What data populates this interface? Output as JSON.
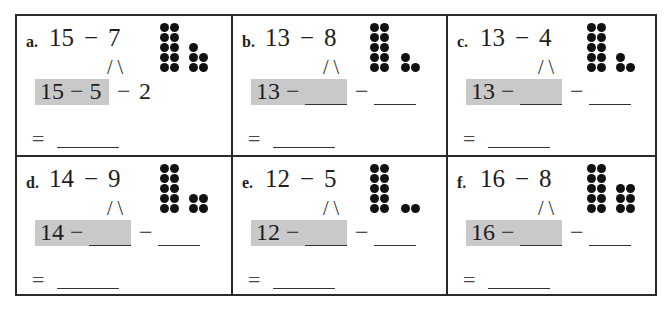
{
  "worksheet": {
    "problems": [
      {
        "label": "a.",
        "minuend": "15",
        "minus": "−",
        "subtrahend": "7",
        "split": "/   \\",
        "highlight_text": "15 − 5",
        "part1": "5",
        "rest_minus": "−",
        "part2": "2",
        "equals": "=",
        "tens_dots": 10,
        "ones_rows": [
          1,
          2,
          2
        ],
        "filled": true
      },
      {
        "label": "b.",
        "minuend": "13",
        "minus": "−",
        "subtrahend": "8",
        "split": "/   \\",
        "highlight_text": "13 −",
        "part1": "",
        "rest_minus": "−",
        "part2": "",
        "equals": "=",
        "tens_dots": 10,
        "ones_rows": [
          1,
          2
        ],
        "filled": false
      },
      {
        "label": "c.",
        "minuend": "13",
        "minus": "−",
        "subtrahend": "4",
        "split": "/   \\",
        "highlight_text": "13 −",
        "part1": "",
        "rest_minus": "−",
        "part2": "",
        "equals": "=",
        "tens_dots": 10,
        "ones_rows": [
          1,
          2
        ],
        "filled": false
      },
      {
        "label": "d.",
        "minuend": "14",
        "minus": "−",
        "subtrahend": "9",
        "split": "/   \\",
        "highlight_text": "14 −",
        "part1": "",
        "rest_minus": "−",
        "part2": "",
        "equals": "=",
        "tens_dots": 10,
        "ones_rows": [
          2,
          2
        ],
        "filled": false
      },
      {
        "label": "e.",
        "minuend": "12",
        "minus": "−",
        "subtrahend": "5",
        "split": "/   \\",
        "highlight_text": "12 −",
        "part1": "",
        "rest_minus": "−",
        "part2": "",
        "equals": "=",
        "tens_dots": 10,
        "ones_rows": [
          2
        ],
        "filled": false
      },
      {
        "label": "f.",
        "minuend": "16",
        "minus": "−",
        "subtrahend": "8",
        "split": "/   \\",
        "highlight_text": "16 −",
        "part1": "",
        "rest_minus": "−",
        "part2": "",
        "equals": "=",
        "tens_dots": 10,
        "ones_rows": [
          2,
          2,
          2
        ],
        "filled": false
      }
    ],
    "colors": {
      "highlight": "#c9c9c9",
      "border": "#2a2a2a",
      "dot": "#111111"
    }
  }
}
